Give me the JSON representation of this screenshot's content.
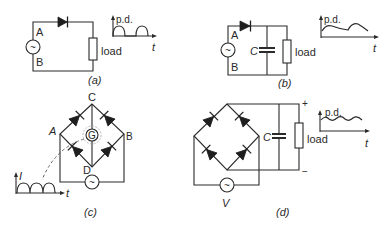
{
  "figure": {
    "a": {
      "caption": "(a)",
      "terminal_top": "A",
      "terminal_bottom": "B",
      "load_label": "load",
      "graph_ylabel": "p.d.",
      "graph_xlabel": "t",
      "waveform": "half-wave rectified"
    },
    "b": {
      "caption": "(b)",
      "terminal_top": "A",
      "terminal_bottom": "B",
      "capacitor_label": "C",
      "load_label": "load",
      "graph_ylabel": "p.d.",
      "graph_xlabel": "t",
      "waveform": "half-wave smoothed"
    },
    "c": {
      "caption": "(c)",
      "node_top": "C",
      "node_left": "A",
      "node_right": "B",
      "node_bottom": "D",
      "meter_label": "G",
      "graph_ylabel": "I",
      "graph_xlabel": "t",
      "waveform": "full-wave rectified"
    },
    "d": {
      "caption": "(d)",
      "capacitor_label": "C",
      "load_label": "load",
      "source_label": "V",
      "plus": "+",
      "minus": "−",
      "graph_ylabel": "p.d.",
      "graph_xlabel": "t",
      "waveform": "full-wave smoothed"
    },
    "ac_symbol": "~"
  }
}
